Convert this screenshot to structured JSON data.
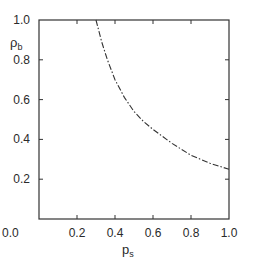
{
  "chart_data": {
    "type": "line",
    "title": "",
    "xlabel": "ρs",
    "ylabel": "ρb",
    "xlim": [
      0.0,
      1.0
    ],
    "ylim": [
      0.0,
      1.0
    ],
    "grid": false,
    "legend": null,
    "x_ticks": [
      "0.0",
      "0.2",
      "0.4",
      "0.6",
      "0.8",
      "1.0"
    ],
    "y_ticks": [
      "0.2",
      "0.4",
      "0.6",
      "0.8",
      "1.0"
    ],
    "series": [
      {
        "name": "boundary curve",
        "style": "dash-dot",
        "x": [
          0.3,
          0.33,
          0.36,
          0.4,
          0.45,
          0.5,
          0.55,
          0.6,
          0.7,
          0.8,
          0.9,
          1.0
        ],
        "y": [
          1.0,
          0.89,
          0.8,
          0.7,
          0.61,
          0.54,
          0.49,
          0.45,
          0.38,
          0.32,
          0.28,
          0.25
        ]
      }
    ]
  },
  "axes": {
    "x_label_main": "p",
    "x_label_sub": "s",
    "y_label_main": "ρ",
    "y_label_sub": "b"
  }
}
